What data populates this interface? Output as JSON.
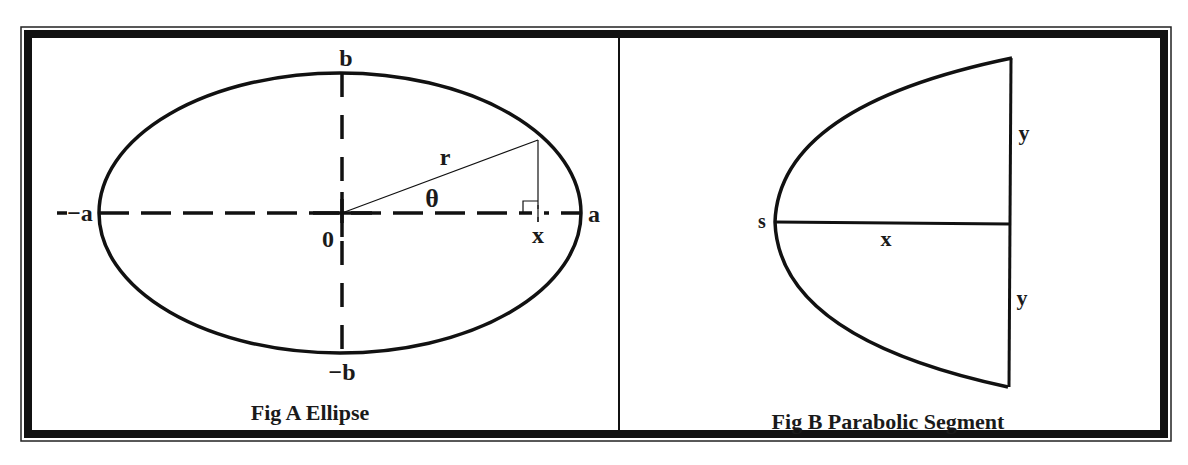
{
  "figure": {
    "colors": {
      "ink": "#111111",
      "background": "#ffffff",
      "frame": "#111111"
    },
    "panels": [
      {
        "id": "fig-a",
        "caption": "Fig A Ellipse",
        "shape": "ellipse",
        "labels": {
          "top": "b",
          "bottom": "−b",
          "left": "−a",
          "right": "a",
          "origin": "0",
          "radius": "r",
          "angle": "θ",
          "foot": "x"
        }
      },
      {
        "id": "fig-b",
        "caption": "Fig B Parabolic Segment",
        "shape": "parabolic-segment",
        "labels": {
          "vertex": "s",
          "axis": "x",
          "upper_half_chord": "y",
          "lower_half_chord": "y"
        }
      }
    ]
  }
}
